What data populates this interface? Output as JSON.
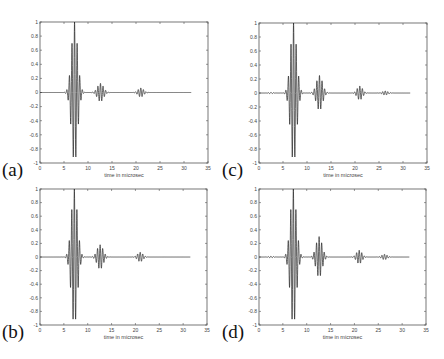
{
  "figure": {
    "panel_labels": [
      "(a)",
      "(c)",
      "(b)",
      "(d)"
    ]
  },
  "chart_data": [
    {
      "id": "a",
      "label": "(a)",
      "type": "line",
      "xlabel": "time in microsec",
      "ylabel": "",
      "xlim": [
        0,
        35
      ],
      "ylim": [
        -1,
        1
      ],
      "xticks": [
        0,
        5,
        10,
        15,
        20,
        25,
        30,
        35
      ],
      "yticks": [
        1,
        0.8,
        0.6,
        0.4,
        0.2,
        0,
        -0.2,
        -0.4,
        -0.6,
        -0.8,
        -1
      ],
      "grid": false,
      "signal_end": 31.5,
      "bursts": [
        {
          "center": 7.2,
          "amp": 1.0,
          "width": 0.9,
          "freq": 1.85
        },
        {
          "center": 12.6,
          "amp": 0.13,
          "width": 0.9,
          "freq": 1.85
        },
        {
          "center": 21.0,
          "amp": 0.065,
          "width": 0.8,
          "freq": 1.85
        }
      ],
      "key_points": [
        {
          "t": 6.1,
          "y": 0.4
        },
        {
          "t": 6.7,
          "y": -0.83
        },
        {
          "t": 7.2,
          "y": 1.0
        },
        {
          "t": 7.8,
          "y": -0.78
        },
        {
          "t": 8.3,
          "y": 0.35
        }
      ]
    },
    {
      "id": "c",
      "label": "(c)",
      "type": "line",
      "xlabel": "time in microsec",
      "ylabel": "",
      "xlim": [
        0,
        35
      ],
      "ylim": [
        -1,
        1
      ],
      "xticks": [
        0,
        5,
        10,
        15,
        20,
        25,
        30,
        35
      ],
      "yticks": [
        1,
        0.8,
        0.6,
        0.4,
        0.2,
        0,
        -0.2,
        -0.4,
        -0.6,
        -0.8,
        -1
      ],
      "grid": false,
      "signal_end": 31.5,
      "bursts": [
        {
          "center": 7.2,
          "amp": 1.0,
          "width": 0.9,
          "freq": 1.85
        },
        {
          "center": 12.6,
          "amp": 0.25,
          "width": 0.9,
          "freq": 1.85
        },
        {
          "center": 21.0,
          "amp": 0.1,
          "width": 0.8,
          "freq": 1.85
        },
        {
          "center": 26.3,
          "amp": 0.03,
          "width": 0.8,
          "freq": 1.85
        },
        {
          "center": 2.5,
          "amp": 0.01,
          "width": 0.6,
          "freq": 1.85
        }
      ],
      "key_points": [
        {
          "t": 6.1,
          "y": 0.42
        },
        {
          "t": 6.7,
          "y": -0.83
        },
        {
          "t": 7.2,
          "y": 1.0
        },
        {
          "t": 7.8,
          "y": -0.76
        },
        {
          "t": 8.3,
          "y": 0.33
        },
        {
          "t": 12.6,
          "y": 0.22
        },
        {
          "t": 13.1,
          "y": -0.21
        }
      ]
    },
    {
      "id": "b",
      "label": "(b)",
      "type": "line",
      "xlabel": "time in microsec",
      "ylabel": "",
      "xlim": [
        0,
        35
      ],
      "ylim": [
        -1,
        1
      ],
      "xticks": [
        0,
        5,
        10,
        15,
        20,
        25,
        30,
        35
      ],
      "yticks": [
        1,
        0.8,
        0.6,
        0.4,
        0.2,
        0,
        -0.2,
        -0.4,
        -0.6,
        -0.8,
        -1
      ],
      "grid": false,
      "signal_end": 31.5,
      "bursts": [
        {
          "center": 7.2,
          "amp": 1.0,
          "width": 0.9,
          "freq": 1.85
        },
        {
          "center": 12.6,
          "amp": 0.18,
          "width": 0.9,
          "freq": 1.85
        },
        {
          "center": 21.0,
          "amp": 0.07,
          "width": 0.8,
          "freq": 1.85
        }
      ],
      "key_points": [
        {
          "t": 6.1,
          "y": 0.42
        },
        {
          "t": 6.7,
          "y": -0.83
        },
        {
          "t": 7.2,
          "y": 1.0
        },
        {
          "t": 7.8,
          "y": -0.77
        },
        {
          "t": 8.3,
          "y": 0.35
        },
        {
          "t": 12.5,
          "y": 0.17
        },
        {
          "t": 13.0,
          "y": -0.17
        }
      ]
    },
    {
      "id": "d",
      "label": "(d)",
      "type": "line",
      "xlabel": "time in microsec",
      "ylabel": "",
      "xlim": [
        0,
        35
      ],
      "ylim": [
        -1,
        1
      ],
      "xticks": [
        0,
        5,
        10,
        15,
        20,
        25,
        30,
        35
      ],
      "yticks": [
        1,
        0.8,
        0.6,
        0.4,
        0.2,
        0,
        -0.2,
        -0.4,
        -0.6,
        -0.8,
        -1
      ],
      "grid": false,
      "signal_end": 31.5,
      "bursts": [
        {
          "center": 7.2,
          "amp": 1.0,
          "width": 0.9,
          "freq": 1.85
        },
        {
          "center": 12.6,
          "amp": 0.3,
          "width": 0.9,
          "freq": 1.85
        },
        {
          "center": 21.0,
          "amp": 0.1,
          "width": 0.8,
          "freq": 1.85
        },
        {
          "center": 26.3,
          "amp": 0.04,
          "width": 0.8,
          "freq": 1.85
        },
        {
          "center": 2.5,
          "amp": 0.012,
          "width": 0.7,
          "freq": 1.85
        }
      ],
      "key_points": [
        {
          "t": 6.1,
          "y": 0.42
        },
        {
          "t": 6.7,
          "y": -0.83
        },
        {
          "t": 7.2,
          "y": 1.0
        },
        {
          "t": 7.8,
          "y": -0.76
        },
        {
          "t": 8.3,
          "y": 0.33
        },
        {
          "t": 12.6,
          "y": 0.29
        },
        {
          "t": 13.1,
          "y": -0.28
        }
      ]
    }
  ],
  "layout_panels": [
    {
      "chart": 0,
      "axes": {
        "x0": 40,
        "y0": 22,
        "x1": 208,
        "y1": 163
      },
      "label_pos": {
        "x": 2,
        "y": 160
      }
    },
    {
      "chart": 1,
      "axes": {
        "x0": 259,
        "y0": 23,
        "x1": 427,
        "y1": 163
      },
      "label_pos": {
        "x": 222,
        "y": 160
      }
    },
    {
      "chart": 2,
      "axes": {
        "x0": 40,
        "y0": 189,
        "x1": 207,
        "y1": 325
      },
      "label_pos": {
        "x": 2,
        "y": 322
      }
    },
    {
      "chart": 3,
      "axes": {
        "x0": 259,
        "y0": 189,
        "x1": 426,
        "y1": 325
      },
      "label_pos": {
        "x": 222,
        "y": 322
      }
    }
  ]
}
